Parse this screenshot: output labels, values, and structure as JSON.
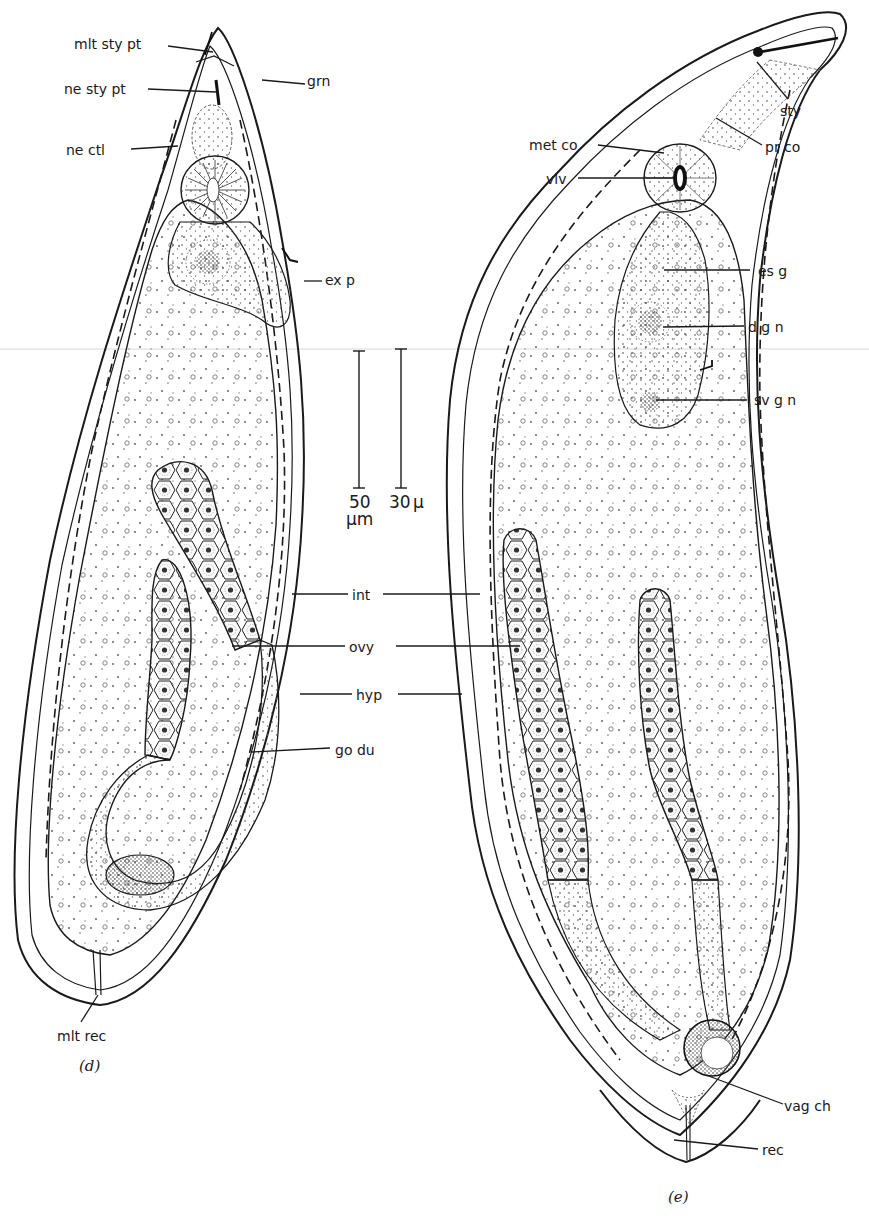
{
  "figure": {
    "colors": {
      "ink": "#1a1a1a",
      "paper": "#ffffff",
      "stipple_fill": "#f2f2f2",
      "dense_fill": "#9a9a9a"
    }
  },
  "panel_d": {
    "caption": "(d)",
    "labels": {
      "mlt_sty_pt": "mlt sty pt",
      "ne_sty_pt": "ne sty pt",
      "grn": "grn",
      "ne_ctl": "ne ctl",
      "ex_p": "ex p",
      "go_du": "go du",
      "mlt_rec": "mlt rec"
    }
  },
  "panel_e": {
    "caption": "(e)",
    "labels": {
      "sty": "sty",
      "met_co": "met co",
      "pr_co": "pr co",
      "vlv": "vlv",
      "es_g": "es g",
      "d_g_n": "d g n",
      "sv_g_n": "sv g n",
      "vag_ch": "vag ch",
      "rec": "rec"
    }
  },
  "shared_labels": {
    "int": "int",
    "ovy": "ovy",
    "hyp": "hyp"
  },
  "scale_bars": [
    {
      "value": "50",
      "unit": "µm"
    },
    {
      "value": "30",
      "unit": "µ"
    }
  ]
}
